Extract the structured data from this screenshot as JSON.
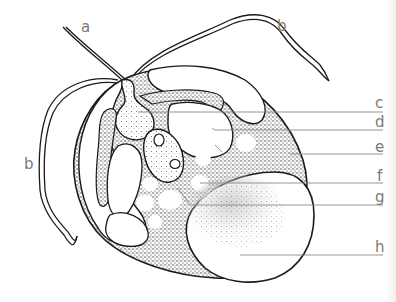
{
  "figure": {
    "type": "labeled biological diagram",
    "colors": {
      "ink": "#1a1a1a",
      "stipple": "#333333",
      "label_text": "#7a7a7a",
      "leader_line": "#8a8a8a",
      "background": "#ffffff"
    }
  },
  "labels": [
    {
      "id": "a",
      "text": "a"
    },
    {
      "id": "b_top",
      "text": "b"
    },
    {
      "id": "b_left",
      "text": "b"
    },
    {
      "id": "c",
      "text": "c"
    },
    {
      "id": "d",
      "text": "d"
    },
    {
      "id": "e",
      "text": "e"
    },
    {
      "id": "f",
      "text": "f"
    },
    {
      "id": "g",
      "text": "g"
    },
    {
      "id": "h",
      "text": "h"
    }
  ]
}
